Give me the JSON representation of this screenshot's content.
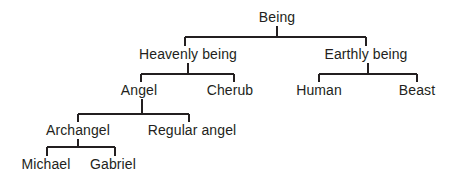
{
  "diagram": {
    "type": "hierarchy-tree",
    "title": "",
    "background_color": "#ffffff",
    "line_color": "#231f20",
    "text_color": "#231f20",
    "root": "Being",
    "nodes": [
      {
        "id": "being",
        "label": "Being",
        "level": 0,
        "cx": 277,
        "cy": 17,
        "parent": null
      },
      {
        "id": "heavenly-being",
        "label": "Heavenly being",
        "level": 1,
        "cx": 188,
        "cy": 54,
        "parent": "being"
      },
      {
        "id": "earthly-being",
        "label": "Earthly being",
        "level": 1,
        "cx": 366,
        "cy": 54,
        "parent": "being"
      },
      {
        "id": "angel",
        "label": "Angel",
        "level": 2,
        "cx": 139,
        "cy": 90,
        "parent": "heavenly-being"
      },
      {
        "id": "cherub",
        "label": "Cherub",
        "level": 2,
        "cx": 230,
        "cy": 90,
        "parent": "heavenly-being"
      },
      {
        "id": "human",
        "label": "Human",
        "level": 2,
        "cx": 319,
        "cy": 90,
        "parent": "earthly-being"
      },
      {
        "id": "beast",
        "label": "Beast",
        "level": 2,
        "cx": 417,
        "cy": 90,
        "parent": "earthly-being"
      },
      {
        "id": "archangel",
        "label": "Archangel",
        "level": 3,
        "cx": 78,
        "cy": 130,
        "parent": "angel"
      },
      {
        "id": "regular-angel",
        "label": "Regular angel",
        "level": 3,
        "cx": 192,
        "cy": 130,
        "parent": "angel"
      },
      {
        "id": "michael",
        "label": "Michael",
        "level": 4,
        "cx": 46,
        "cy": 164,
        "parent": "archangel"
      },
      {
        "id": "gabriel",
        "label": "Gabriel",
        "level": 4,
        "cx": 113,
        "cy": 164,
        "parent": "archangel"
      }
    ],
    "edges": [
      {
        "id": "being-to-level1",
        "from": "being",
        "stem_x": 277,
        "stem_top": 26,
        "bar_y": 37,
        "bar_x1": 185,
        "bar_x2": 366,
        "drop_to": 46,
        "children": [
          "heavenly-being",
          "earthly-being"
        ]
      },
      {
        "id": "heavenly-to-level2",
        "from": "heavenly-being",
        "stem_x": 188,
        "stem_top": 63,
        "bar_y": 74,
        "bar_x1": 141,
        "bar_x2": 234,
        "drop_to": 82,
        "children": [
          "angel",
          "cherub"
        ]
      },
      {
        "id": "earthly-to-level2",
        "from": "earthly-being",
        "stem_x": 368,
        "stem_top": 63,
        "bar_y": 74,
        "bar_x1": 319,
        "bar_x2": 417,
        "drop_to": 82,
        "children": [
          "human",
          "beast"
        ]
      },
      {
        "id": "angel-to-level3",
        "from": "angel",
        "stem_x": 142,
        "stem_top": 99,
        "bar_y": 114,
        "bar_x1": 78,
        "bar_x2": 189,
        "drop_to": 122,
        "children": [
          "archangel",
          "regular-angel"
        ]
      },
      {
        "id": "archangel-to-level4",
        "from": "archangel",
        "stem_x": 78,
        "stem_top": 139,
        "bar_y": 147,
        "bar_x1": 47,
        "bar_x2": 115,
        "drop_to": 156,
        "children": [
          "michael",
          "gabriel"
        ]
      }
    ]
  }
}
